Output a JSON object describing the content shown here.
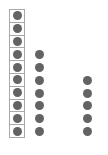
{
  "diagram": {
    "dot_color": "#636363",
    "frame_color": "#a8a8a8",
    "columns": [
      {
        "name": "framed-column",
        "count": 10,
        "framed": true,
        "start_row": 0
      },
      {
        "name": "middle-column",
        "count": 7,
        "framed": false,
        "start_row": 3
      },
      {
        "name": "right-column",
        "count": 5,
        "framed": false,
        "start_row": 5
      }
    ]
  }
}
